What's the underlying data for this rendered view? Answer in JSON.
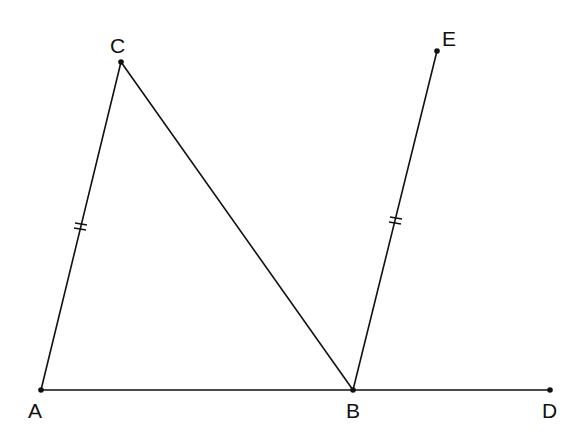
{
  "diagram": {
    "type": "geometry-figure",
    "points": {
      "A": {
        "label": "A",
        "x": 41,
        "y": 390,
        "lx": 28,
        "ly": 418
      },
      "B": {
        "label": "B",
        "x": 353,
        "y": 390,
        "lx": 346,
        "ly": 418
      },
      "C": {
        "label": "C",
        "x": 121,
        "y": 62,
        "lx": 110,
        "ly": 53
      },
      "D": {
        "label": "D",
        "x": 550,
        "y": 390,
        "lx": 542,
        "ly": 418
      },
      "E": {
        "label": "E",
        "x": 437,
        "y": 51,
        "lx": 442,
        "ly": 46
      }
    },
    "segments": [
      {
        "name": "AC",
        "from": "A",
        "to": "C",
        "equal_mark": "double-tick"
      },
      {
        "name": "CB",
        "from": "C",
        "to": "B",
        "equal_mark": null
      },
      {
        "name": "AD",
        "from": "A",
        "to": "D",
        "equal_mark": null
      },
      {
        "name": "BE",
        "from": "B",
        "to": "E",
        "equal_mark": "double-tick"
      }
    ],
    "relations": [
      "AC = BE"
    ],
    "colors": {
      "stroke": "#111111",
      "background": "#ffffff"
    }
  }
}
